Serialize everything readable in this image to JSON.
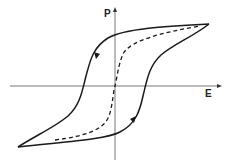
{
  "diagram": {
    "type": "hysteresis-loop",
    "axes": {
      "x_label": "E",
      "y_label": "P"
    },
    "curves": [
      {
        "name": "descending-branch",
        "style": "solid",
        "direction_arrow": "down-left"
      },
      {
        "name": "ascending-branch",
        "style": "solid",
        "direction_arrow": "up-right"
      },
      {
        "name": "initial-polarization-curve",
        "style": "dashed"
      }
    ],
    "colors": {
      "line": "#1a1a1a",
      "axis": "#555555",
      "background": "#ffffff"
    }
  }
}
